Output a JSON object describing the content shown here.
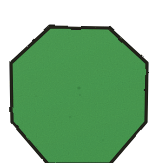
{
  "image": {
    "kind": "scanned-drawing",
    "subject_label": "octagon",
    "width": 158,
    "height": 163,
    "background_color": "#ffffff",
    "cropped_at_bottom": true
  },
  "shape": {
    "name": "octagon",
    "sides": 8,
    "fill_color": "#4a9b52",
    "fill_color_light": "#5aa861",
    "fill_color_dark": "#3f8c48",
    "outline_color": "#1a1a14",
    "outline_width": 3,
    "texture": "mottled paper grain",
    "points": "50,27 109,28 147,63 146,122 110,164 48,164 12,122 11,63",
    "vertices": [
      {
        "name": "top-left",
        "x": 50,
        "y": 27
      },
      {
        "name": "top-right",
        "x": 109,
        "y": 28
      },
      {
        "name": "right-top",
        "x": 147,
        "y": 63
      },
      {
        "name": "right-bottom",
        "x": 146,
        "y": 122
      },
      {
        "name": "bottom-right",
        "x": 110,
        "y": 164
      },
      {
        "name": "bottom-left",
        "x": 48,
        "y": 164
      },
      {
        "name": "left-bottom",
        "x": 12,
        "y": 122
      },
      {
        "name": "left-top",
        "x": 11,
        "y": 63
      }
    ]
  }
}
